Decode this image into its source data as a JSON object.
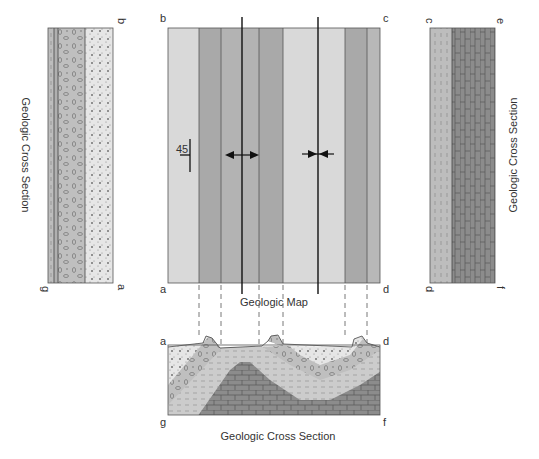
{
  "figure": {
    "map": {
      "title": "Geologic Map",
      "corners": {
        "top_left": "b",
        "top_right": "c",
        "bottom_left": "a",
        "bottom_right": "d"
      },
      "strike_dip": {
        "value": "45"
      },
      "bands": [
        {
          "x1": 168,
          "x2": 199,
          "color": "#d9d9d9"
        },
        {
          "x1": 199,
          "x2": 221,
          "color": "#a6a6a6"
        },
        {
          "x1": 221,
          "x2": 259,
          "color": "#b3b3b3"
        },
        {
          "x1": 259,
          "x2": 283,
          "color": "#a6a6a6"
        },
        {
          "x1": 283,
          "x2": 345,
          "color": "#d9d9d9"
        },
        {
          "x1": 345,
          "x2": 367,
          "color": "#a6a6a6"
        },
        {
          "x1": 367,
          "x2": 380,
          "color": "#b8b8b8"
        }
      ],
      "fold_axes": [
        {
          "x": 242,
          "type": "anticline"
        },
        {
          "x": 318,
          "type": "syncline"
        }
      ]
    },
    "left_section": {
      "title": "Geologic Cross Section",
      "corners": {
        "top": "b",
        "bottom_right": "a",
        "bottom_left": "g"
      }
    },
    "right_section": {
      "title": "Geologic Cross Section",
      "corners": {
        "top_left": "c",
        "top_right": "e",
        "bottom_left": "d",
        "bottom_right": "f"
      }
    },
    "bottom_section": {
      "title": "Geologic Cross Section",
      "corners": {
        "top_left": "a",
        "top_right": "d",
        "bottom_left": "g",
        "bottom_right": "f"
      }
    },
    "colors": {
      "sandstone": "#e6e6e6",
      "conglomerate": "#bfbfbf",
      "shale": "#cccccc",
      "limestone": "#8c8c8c",
      "line": "#333333"
    }
  }
}
